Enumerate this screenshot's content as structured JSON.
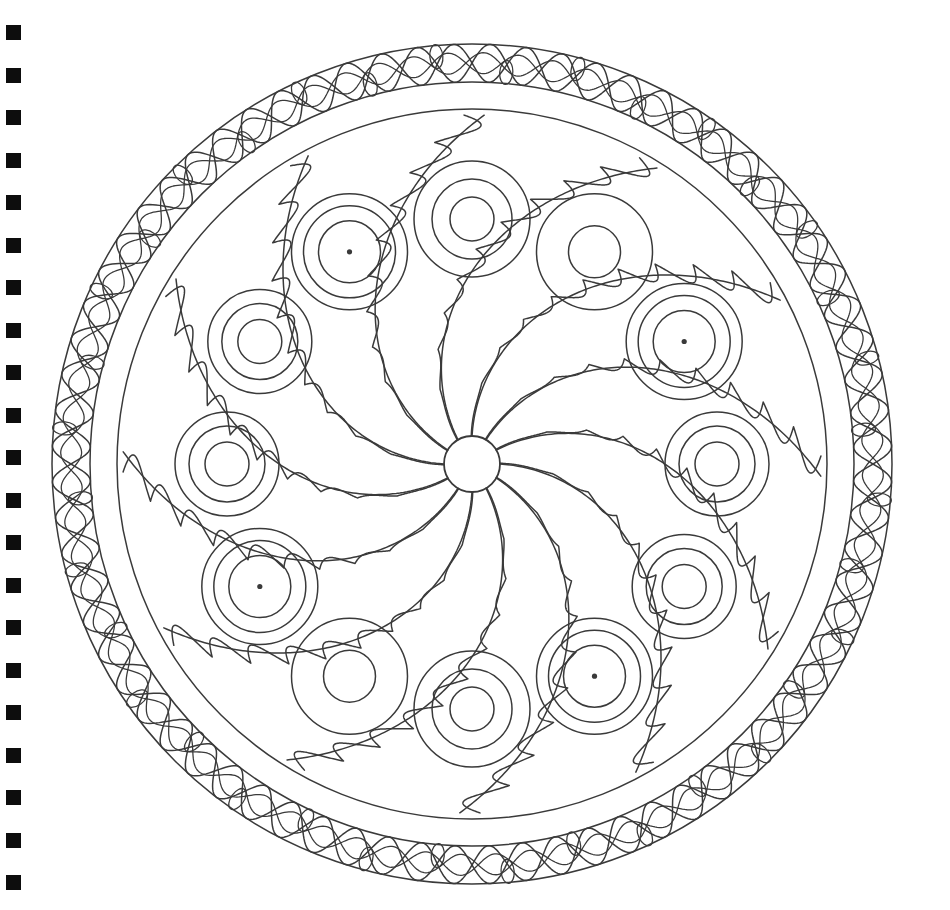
{
  "page": {
    "kind": "line-art-coloring-page",
    "width": 950,
    "height": 910,
    "background_color": "#ffffff",
    "ink_color": "#3a3a3a",
    "binding_color": "#0d0d0d",
    "line_width": 1.5
  },
  "binding": {
    "name": "spiral-binding-holes",
    "shape": "square",
    "count": 21,
    "square_size": 15,
    "x": 6,
    "first_y": 25,
    "spacing": 42.5,
    "color": "#0d0d0d"
  },
  "mandala": {
    "center_x": 472,
    "center_y": 464,
    "outer_border_radius": 420,
    "inner_border_radius": 382,
    "field_radius": 355,
    "hub_radius": 28,
    "arm_count": 12,
    "motif_count": 12,
    "motif_ring_radius": 245,
    "braid": {
      "name": "celtic-braid-border",
      "strand_count": 36,
      "strand_amplitude": 19,
      "lens_count": 36,
      "lens_radius": 13,
      "description": "interlaced over-under double strand weave between outer and inner border circles"
    },
    "hub": {
      "name": "center-hub-circle",
      "radius": 28
    },
    "arms": {
      "name": "spiral-arms",
      "count": 12,
      "sweep_degrees": 62,
      "scallop_lobes": 5,
      "description": "twelve logarithmic spiral arms radiating from hub; alternating arms carry scalloped cloud-like outer edges with pointed tips"
    },
    "motifs": [
      {
        "index": 0,
        "angle_deg": -90,
        "rings": 3,
        "center_dot": false,
        "outer_r": 58,
        "radii": [
          58,
          40,
          22
        ]
      },
      {
        "index": 1,
        "angle_deg": -60,
        "rings": 2,
        "center_dot": false,
        "outer_r": 58,
        "radii": [
          58,
          26
        ]
      },
      {
        "index": 2,
        "angle_deg": -30,
        "rings": 3,
        "center_dot": true,
        "outer_r": 58,
        "radii": [
          58,
          46,
          31
        ]
      },
      {
        "index": 3,
        "angle_deg": 0,
        "rings": 3,
        "center_dot": false,
        "outer_r": 52,
        "radii": [
          52,
          38,
          22
        ]
      },
      {
        "index": 4,
        "angle_deg": 30,
        "rings": 3,
        "center_dot": false,
        "outer_r": 52,
        "radii": [
          52,
          38,
          22
        ]
      },
      {
        "index": 5,
        "angle_deg": 60,
        "rings": 3,
        "center_dot": true,
        "outer_r": 58,
        "radii": [
          58,
          46,
          31
        ]
      },
      {
        "index": 6,
        "angle_deg": 90,
        "rings": 3,
        "center_dot": false,
        "outer_r": 58,
        "radii": [
          58,
          40,
          22
        ]
      },
      {
        "index": 7,
        "angle_deg": 120,
        "rings": 2,
        "center_dot": false,
        "outer_r": 58,
        "radii": [
          58,
          26
        ]
      },
      {
        "index": 8,
        "angle_deg": 150,
        "rings": 3,
        "center_dot": true,
        "outer_r": 58,
        "radii": [
          58,
          46,
          31
        ]
      },
      {
        "index": 9,
        "angle_deg": 180,
        "rings": 3,
        "center_dot": false,
        "outer_r": 52,
        "radii": [
          52,
          38,
          22
        ]
      },
      {
        "index": 10,
        "angle_deg": 210,
        "rings": 3,
        "center_dot": false,
        "outer_r": 52,
        "radii": [
          52,
          38,
          22
        ]
      },
      {
        "index": 11,
        "angle_deg": 240,
        "rings": 3,
        "center_dot": true,
        "outer_r": 58,
        "radii": [
          58,
          46,
          31
        ]
      }
    ]
  }
}
